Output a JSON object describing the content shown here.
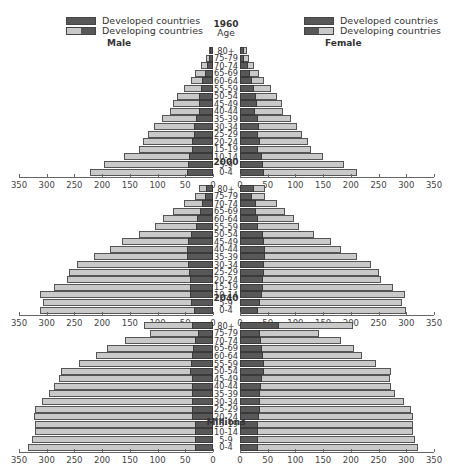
{
  "legend": {
    "developed": "Developed countries",
    "developing": "Developing countries"
  },
  "labels": {
    "male": "Male",
    "female": "Female",
    "age": "Age",
    "units": "Millions"
  },
  "colors": {
    "developed": "#585858",
    "developing": "#c9c9c9",
    "border": "#3a3a3a"
  },
  "axis_ticks": [
    "350",
    "300",
    "250",
    "200",
    "150",
    "100",
    "50",
    "0"
  ],
  "axis_ticks_right": [
    "0",
    "50",
    "100",
    "150",
    "200",
    "250",
    "300",
    "350"
  ],
  "chart_data": {
    "type": "bar",
    "subtype": "population pyramid (stacked, horizontal)",
    "title": "",
    "xlabel": "Millions",
    "ylabel": "Age",
    "xlim": [
      0,
      350
    ],
    "grid": false,
    "legend": [
      "Developed countries",
      "Developing countries"
    ],
    "legend_position": "top-left and top-right",
    "categories": [
      "80+",
      "75-79",
      "70-74",
      "65-69",
      "60-64",
      "55-59",
      "50-54",
      "45-49",
      "40-44",
      "35-39",
      "30-34",
      "25-29",
      "20-24",
      "15-19",
      "10-14",
      "5-9",
      "0-4"
    ],
    "panels": [
      {
        "year": "1960",
        "male": {
          "developed": [
            5,
            7,
            10,
            14,
            19,
            22,
            25,
            26,
            25,
            30,
            35,
            35,
            37,
            37,
            43,
            45,
            46
          ],
          "total": [
            8,
            13,
            22,
            32,
            40,
            52,
            65,
            72,
            78,
            92,
            107,
            117,
            127,
            133,
            160,
            196,
            222
          ]
        },
        "female": {
          "developed": [
            7,
            8,
            14,
            18,
            21,
            25,
            28,
            30,
            27,
            33,
            35,
            33,
            36,
            33,
            40,
            42,
            44
          ],
          "total": [
            12,
            16,
            26,
            35,
            44,
            56,
            67,
            75,
            77,
            92,
            103,
            112,
            122,
            128,
            150,
            188,
            211
          ]
        }
      },
      {
        "year": "2000",
        "male": {
          "developed": [
            12,
            14,
            20,
            24,
            29,
            30,
            39,
            45,
            47,
            47,
            45,
            44,
            42,
            42,
            42,
            40,
            35
          ],
          "total": [
            26,
            33,
            53,
            72,
            91,
            105,
            134,
            165,
            185,
            215,
            245,
            260,
            264,
            287,
            312,
            306,
            312
          ]
        },
        "female": {
          "developed": [
            25,
            22,
            28,
            29,
            32,
            33,
            41,
            43,
            46,
            46,
            44,
            43,
            41,
            41,
            39,
            36,
            33
          ],
          "total": [
            46,
            46,
            66,
            81,
            97,
            106,
            134,
            165,
            183,
            211,
            237,
            250,
            254,
            276,
            298,
            292,
            299
          ]
        }
      },
      {
        "year": "2040",
        "male": {
          "developed": [
            38,
            27,
            33,
            36,
            38,
            40,
            41,
            38,
            37,
            37,
            37,
            37,
            37,
            33,
            33,
            33,
            33
          ],
          "total": [
            124,
            113,
            159,
            191,
            211,
            242,
            275,
            278,
            287,
            295,
            308,
            321,
            323,
            322,
            322,
            327,
            333
          ]
        },
        "female": {
          "developed": [
            71,
            36,
            38,
            40,
            42,
            43,
            43,
            40,
            37,
            36,
            36,
            36,
            34,
            32,
            32,
            32,
            32
          ],
          "total": [
            203,
            142,
            182,
            206,
            220,
            245,
            272,
            270,
            273,
            280,
            296,
            309,
            312,
            312,
            312,
            315,
            322
          ]
        }
      }
    ]
  }
}
